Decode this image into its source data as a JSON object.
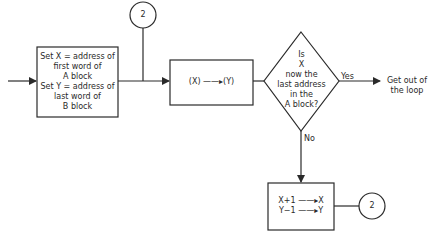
{
  "diagram": {
    "init_box": {
      "lines": [
        "Set X = address of",
        "first word of",
        "A block",
        "Set Y = address of",
        "last word of",
        "B block"
      ]
    },
    "connector_top": {
      "label": "2"
    },
    "copy_box": {
      "label": "(X) ——▸(Y)"
    },
    "decision": {
      "lines": [
        "Is",
        "X",
        "now the",
        "last address",
        "in the",
        "A block?"
      ],
      "yes_label": "Yes",
      "no_label": "No"
    },
    "exit": {
      "lines": [
        "Get out of",
        "the loop"
      ]
    },
    "increment_box": {
      "lines": [
        "X+1 ——▸X",
        "Y−1 ——▸Y"
      ]
    },
    "connector_bottom": {
      "label": "2"
    },
    "colors": {
      "stroke": "#2a2a2a",
      "background": "#ffffff"
    }
  }
}
